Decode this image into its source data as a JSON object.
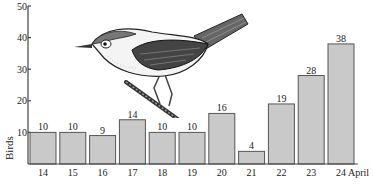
{
  "chart_data": {
    "type": "bar",
    "title": "",
    "xlabel": "",
    "x_unit_label": "April",
    "ylabel": "Birds",
    "ylim": [
      0,
      50
    ],
    "yticks": [
      10,
      20,
      30,
      40,
      50
    ],
    "grid": false,
    "legend": null,
    "categories": [
      "14",
      "15",
      "16",
      "17",
      "18",
      "19",
      "20",
      "21",
      "22",
      "23",
      "24"
    ],
    "values": [
      10,
      10,
      9,
      14,
      10,
      10,
      16,
      4,
      19,
      28,
      38
    ],
    "data_labels": [
      "10",
      "10",
      "9",
      "14",
      "10",
      "10",
      "16",
      "4",
      "19",
      "28",
      "38"
    ],
    "annotations": [
      "illustration of a small songbird perched on a twig"
    ]
  },
  "style": {
    "bar_fill": "#c9c9c9",
    "bar_stroke": "#555555",
    "axis_color": "#444444"
  }
}
